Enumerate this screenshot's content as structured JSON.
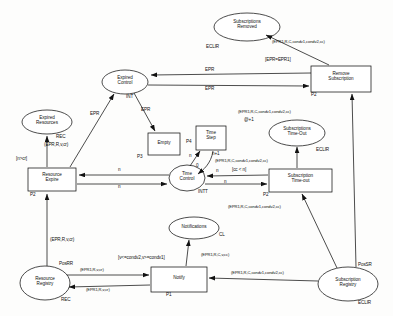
{
  "diagram": {
    "type": "petri-net",
    "colors": {
      "stroke": "#111111",
      "fill": "#ffffff",
      "background": "#fdfdfc"
    },
    "places": [
      {
        "id": "subs_removed",
        "label_line1": "Subscriptions",
        "label_line2": "Removed",
        "annotation": "ECLIR"
      },
      {
        "id": "expired_control",
        "label_line1": "Expired",
        "label_line2": "Control",
        "annotation": "INT"
      },
      {
        "id": "expired_resources",
        "label_line1": "Expired",
        "label_line2": "Resources",
        "annotation": "REC"
      },
      {
        "id": "time_control",
        "label_line1": "Time",
        "label_line2": "Control",
        "annotation": "INTT"
      },
      {
        "id": "subs_timeout",
        "label_line1": "Subscriptions",
        "label_line2": "Time-Out",
        "annotation": "ECLIR"
      },
      {
        "id": "notifications",
        "label_line1": "Notifications",
        "label_line2": "",
        "annotation": "CL"
      },
      {
        "id": "resource_registry",
        "label_line1": "Resource",
        "label_line2": "Registry",
        "annotation_top": "PosRR",
        "annotation_bottom": "REC"
      },
      {
        "id": "subscription_registry",
        "label_line1": "Subscription",
        "label_line2": "Registry",
        "annotation_top": "PosSR",
        "annotation_bottom": "ECLIR"
      }
    ],
    "transitions": [
      {
        "id": "remove_subscription",
        "label_line1": "Remove",
        "label_line2": "Subscription",
        "annotation": "P2"
      },
      {
        "id": "empty",
        "label_line1": "Empty",
        "label_line2": "",
        "annotation": "P3"
      },
      {
        "id": "time_step",
        "label_line1": "Time",
        "label_line2": "Step",
        "annotation": "P4"
      },
      {
        "id": "resource_expire",
        "label_line1": "Resource",
        "label_line2": "Expire",
        "annotation": "P2"
      },
      {
        "id": "subscription_timeout",
        "label_line1": "Subscription",
        "label_line2": "Time-out",
        "annotation": "P2"
      },
      {
        "id": "notify",
        "label_line1": "Notify",
        "label_line2": "",
        "annotation": "P1"
      }
    ],
    "guards": [
      {
        "id": "g_epr_eq",
        "text": "[EPR=EPR1]"
      },
      {
        "id": "g_n_gt_cr",
        "text": "[n>cr]"
      },
      {
        "id": "g_cc_lt_n",
        "text": "[cc < n]"
      },
      {
        "id": "g_condv",
        "text": "[v<=condv2,v>=condv1]"
      }
    ],
    "arc_labels": [
      {
        "id": "a1",
        "text": "(EPR1,R,C,condv1,condv2,cc)"
      },
      {
        "id": "a2",
        "text": "EPR"
      },
      {
        "id": "a3",
        "text": "EPR"
      },
      {
        "id": "a4",
        "text": "EPR"
      },
      {
        "id": "a5",
        "text": "EPR"
      },
      {
        "id": "a6",
        "text": "(EPR,R,v,cr)"
      },
      {
        "id": "a7",
        "text": "(EPR1,R,C,condv1,condv2,cc)"
      },
      {
        "id": "a8",
        "text": "@+1"
      },
      {
        "id": "a9",
        "text": "n"
      },
      {
        "id": "a10",
        "text": "0"
      },
      {
        "id": "a11",
        "text": "n+1"
      },
      {
        "id": "a12",
        "text": "(EPR1,R,C,condv1,condv2,cc)"
      },
      {
        "id": "a13",
        "text": "n"
      },
      {
        "id": "a14",
        "text": "n"
      },
      {
        "id": "a15",
        "text": "n"
      },
      {
        "id": "a16",
        "text": "n"
      },
      {
        "id": "a17",
        "text": "(EPR,R,v,cr)"
      },
      {
        "id": "a18",
        "text": "(EPR1,R,C,condv1,condv2,cc)"
      },
      {
        "id": "a19",
        "text": "(EPR1,R,C,v,cc)"
      },
      {
        "id": "a20",
        "text": "(EPR1,R,v,cr)"
      },
      {
        "id": "a21",
        "text": "(EPR1,R,v,cr)"
      },
      {
        "id": "a22",
        "text": "(EPR1,R,C,condv1,condv2,cc)"
      }
    ]
  }
}
